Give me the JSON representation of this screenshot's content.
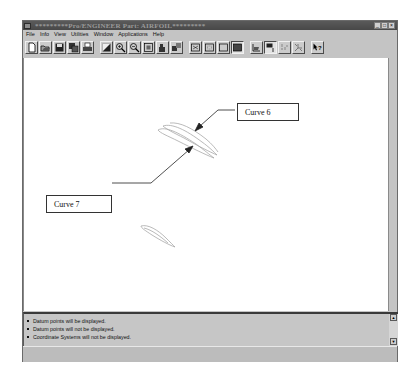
{
  "window": {
    "title": "*********Pro/ENGINEER Part: AIRFOIL*********",
    "controls": [
      {
        "name": "minimize",
        "glyph": "_"
      },
      {
        "name": "maximize",
        "glyph": "□"
      },
      {
        "name": "close",
        "glyph": "×"
      }
    ]
  },
  "menubar": {
    "items": [
      {
        "label": "File"
      },
      {
        "label": "Info"
      },
      {
        "label": "View"
      },
      {
        "label": "Utilities"
      },
      {
        "label": "Window"
      },
      {
        "label": "Applications"
      },
      {
        "label": "Help"
      }
    ]
  },
  "toolbar": {
    "buttons": [
      {
        "icon": "new-file-icon"
      },
      {
        "icon": "open-folder-icon"
      },
      {
        "icon": "save-icon"
      },
      {
        "icon": "save-copy-icon"
      },
      {
        "icon": "print-icon"
      },
      {
        "icon": "repaint-icon"
      },
      {
        "icon": "zoom-in-icon"
      },
      {
        "icon": "zoom-out-icon"
      },
      {
        "icon": "refit-icon"
      },
      {
        "icon": "orient-icon"
      },
      {
        "icon": "saved-views-icon"
      },
      {
        "icon": "wireframe-icon"
      },
      {
        "icon": "hidden-line-icon"
      },
      {
        "icon": "no-hidden-icon"
      },
      {
        "icon": "shading-icon",
        "pressed": true
      },
      {
        "icon": "datum-planes-icon"
      },
      {
        "icon": "datum-axes-icon",
        "pressed": true
      },
      {
        "icon": "datum-points-icon"
      },
      {
        "icon": "coordinate-systems-icon"
      },
      {
        "icon": "context-help-icon"
      }
    ]
  },
  "graphics": {
    "callouts": [
      {
        "label": "Curve 6"
      },
      {
        "label": "Curve 7"
      }
    ]
  },
  "messages": {
    "lines": [
      "Datum points will be displayed.",
      "Datum points will not be displayed.",
      "Coordinate Systems will not be displayed."
    ]
  },
  "scrollbar": {
    "up_glyph": "▲",
    "down_glyph": "▼"
  }
}
